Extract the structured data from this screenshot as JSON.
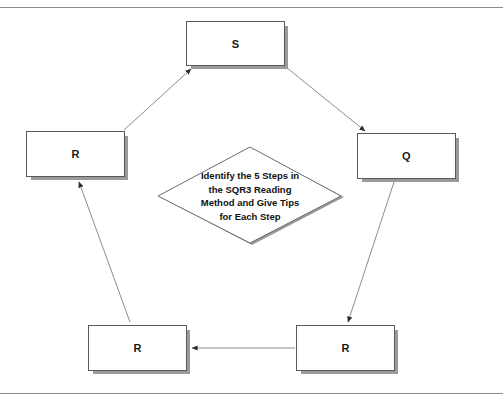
{
  "diagram": {
    "type": "cycle-diagram",
    "center": {
      "shape": "diamond",
      "text_lines": [
        "Identify the 5 Steps in",
        "the SQR3 Reading",
        "Method and Give Tips",
        "for Each Step"
      ]
    },
    "nodes": [
      {
        "id": "s",
        "label": "S",
        "position": "top"
      },
      {
        "id": "q",
        "label": "Q",
        "position": "right"
      },
      {
        "id": "r_bottom_right",
        "label": "R",
        "position": "bottom-right"
      },
      {
        "id": "r_bottom_left",
        "label": "R",
        "position": "bottom-left"
      },
      {
        "id": "r_left",
        "label": "R",
        "position": "left"
      }
    ],
    "edges": [
      {
        "from": "s",
        "to": "q",
        "direction": "down-right"
      },
      {
        "from": "q",
        "to": "r_bottom_right",
        "direction": "down-left"
      },
      {
        "from": "r_bottom_right",
        "to": "r_bottom_left",
        "direction": "left"
      },
      {
        "from": "r_bottom_left",
        "to": "r_left",
        "direction": "up-left"
      },
      {
        "from": "r_left",
        "to": "s",
        "direction": "up-right"
      }
    ],
    "colors": {
      "box_border": "#595959",
      "box_fill": "#ffffff",
      "box_shadow": "#9a9a9a",
      "arrow": "#7a7a7a",
      "arrow_head": "#2b2b2b",
      "frame_line": "#8a8a8a",
      "text": "#1a1a1a",
      "background": "#ffffff"
    }
  }
}
